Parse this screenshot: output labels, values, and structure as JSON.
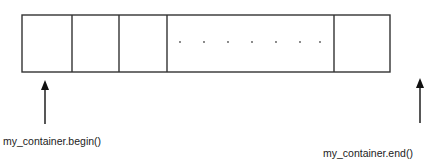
{
  "diagram": {
    "title": "",
    "container": {
      "cells": [
        {
          "x1": 22,
          "x2": 72,
          "content": ""
        },
        {
          "x1": 72,
          "x2": 119,
          "content": ""
        },
        {
          "x1": 119,
          "x2": 167,
          "content": ""
        },
        {
          "x1": 167,
          "x2": 334,
          "content": ". . . . . . ."
        },
        {
          "x1": 334,
          "x2": 390,
          "content": ""
        }
      ]
    },
    "labels": {
      "begin": "my_container.begin()",
      "end": "my_container.end()"
    },
    "colors": {
      "stroke": "#333333",
      "text": "#222222"
    }
  }
}
